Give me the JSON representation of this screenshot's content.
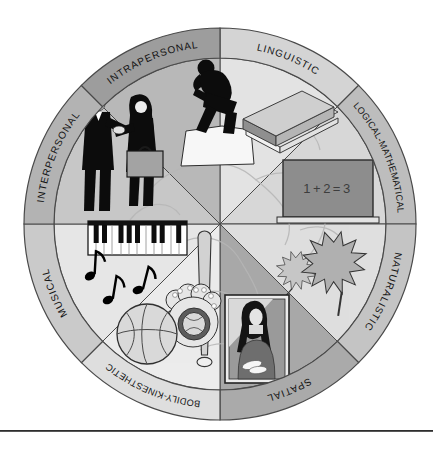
{
  "figure": {
    "name": "multiple-intelligences-wheel",
    "background": "#ffffff",
    "divider_color": "#2e2e2e",
    "label_color": "#141414"
  },
  "board": {
    "equation": "1+2=3"
  },
  "segments": [
    {
      "id": "linguistic",
      "label": "LINGUISTIC",
      "ring_color": "#d4d4d4",
      "wedge_color": "#e3e3e3",
      "icon": "book-icon"
    },
    {
      "id": "logical-mathematical",
      "label": "LOGICAL-MATHEMATICAL",
      "ring_color": "#bdbdbd",
      "wedge_color": "#d7d7d7",
      "icon": "chalkboard-icon"
    },
    {
      "id": "naturalistic",
      "label": "NATURALISTIC",
      "ring_color": "#c4c4c4",
      "wedge_color": "#dfdfdf",
      "icon": "oak-leaves-icon"
    },
    {
      "id": "spatial",
      "label": "SPATIAL",
      "ring_color": "#aaaaaa",
      "wedge_color": "#a8a8a8",
      "icon": "mona-lisa-icon"
    },
    {
      "id": "bodily-kinesthetic",
      "label": "BODILY-KINESTHETIC",
      "ring_color": "#dedede",
      "wedge_color": "#ececec",
      "icon": "sports-equipment-icon"
    },
    {
      "id": "musical",
      "label": "MUSICAL",
      "ring_color": "#cacaca",
      "wedge_color": "#e6e6e6",
      "icon": "piano-notes-icon"
    },
    {
      "id": "interpersonal",
      "label": "INTERPERSONAL",
      "ring_color": "#b3b3b3",
      "wedge_color": "#c7c7c7",
      "icon": "handshake-people-icon"
    },
    {
      "id": "intrapersonal",
      "label": "INTRAPERSONAL",
      "ring_color": "#9d9d9d",
      "wedge_color": "#b8b8b8",
      "icon": "thinker-statue-icon"
    }
  ]
}
